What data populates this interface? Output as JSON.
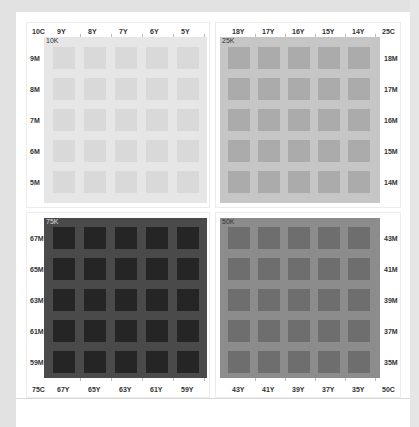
{
  "panels": [
    {
      "id": "10K",
      "k_label": "10K",
      "corner_label": "10C",
      "bg": "#e6e6e6",
      "tile": "#d9d9d9",
      "y_labels": [
        "9Y",
        "8Y",
        "7Y",
        "6Y",
        "5Y"
      ],
      "m_labels": [
        "9M",
        "8M",
        "7M",
        "6M",
        "5M"
      ]
    },
    {
      "id": "25K",
      "k_label": "25K",
      "corner_label": "25C",
      "bg": "#c6c6c6",
      "tile": "#ababab",
      "y_labels": [
        "18Y",
        "17Y",
        "16Y",
        "15Y",
        "14Y"
      ],
      "m_labels": [
        "18M",
        "17M",
        "16M",
        "15M",
        "14M"
      ]
    },
    {
      "id": "75K",
      "k_label": "75K",
      "corner_label": "75C",
      "bg": "#4a4a4a",
      "tile": "#252525",
      "y_labels": [
        "67Y",
        "65Y",
        "63Y",
        "61Y",
        "59Y"
      ],
      "m_labels": [
        "67M",
        "65M",
        "63M",
        "61M",
        "59M"
      ]
    },
    {
      "id": "50K",
      "k_label": "50K",
      "corner_label": "50C",
      "bg": "#8c8c8c",
      "tile": "#6e6e6e",
      "y_labels": [
        "43Y",
        "41Y",
        "39Y",
        "37Y",
        "35Y"
      ],
      "m_labels": [
        "43M",
        "41M",
        "39M",
        "37M",
        "35M"
      ]
    }
  ]
}
